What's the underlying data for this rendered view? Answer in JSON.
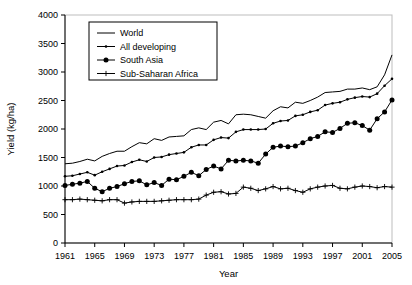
{
  "chart_data": {
    "type": "line",
    "title": "",
    "xlabel": "Year",
    "ylabel": "Yield (kg/ha)",
    "xlim": [
      1961,
      2005
    ],
    "ylim": [
      0,
      4000
    ],
    "ytick_step": 500,
    "xtick_step": 4,
    "grid": false,
    "legend_position": "top-left",
    "yticks": [
      "0",
      "500",
      "1000",
      "1500",
      "2000",
      "2500",
      "3000",
      "3500",
      "4000"
    ],
    "xticks": [
      "1961",
      "1965",
      "1969",
      "1973",
      "1977",
      "1981",
      "1985",
      "1989",
      "1993",
      "1997",
      "2001",
      "2005"
    ],
    "x": [
      1961,
      1962,
      1963,
      1964,
      1965,
      1966,
      1967,
      1968,
      1969,
      1970,
      1971,
      1972,
      1973,
      1974,
      1975,
      1976,
      1977,
      1978,
      1979,
      1980,
      1981,
      1982,
      1983,
      1984,
      1985,
      1986,
      1987,
      1988,
      1989,
      1990,
      1991,
      1992,
      1993,
      1994,
      1995,
      1996,
      1997,
      1998,
      1999,
      2000,
      2001,
      2002,
      2003,
      2004,
      2005
    ],
    "series": [
      {
        "name": "World",
        "marker": "none",
        "values": [
          1390,
          1400,
          1430,
          1470,
          1440,
          1520,
          1570,
          1610,
          1610,
          1690,
          1760,
          1740,
          1830,
          1800,
          1860,
          1870,
          1880,
          1990,
          2020,
          1990,
          2120,
          2150,
          2090,
          2250,
          2260,
          2250,
          2220,
          2190,
          2320,
          2390,
          2370,
          2470,
          2450,
          2500,
          2560,
          2640,
          2650,
          2660,
          2700,
          2700,
          2720,
          2690,
          2740,
          2950,
          3300
        ]
      },
      {
        "name": "All developing",
        "marker": "small-dot",
        "values": [
          1170,
          1180,
          1210,
          1240,
          1190,
          1250,
          1300,
          1350,
          1360,
          1420,
          1460,
          1430,
          1500,
          1510,
          1550,
          1570,
          1590,
          1680,
          1720,
          1720,
          1810,
          1850,
          1840,
          1950,
          1990,
          1990,
          1990,
          2000,
          2100,
          2140,
          2150,
          2230,
          2250,
          2300,
          2330,
          2420,
          2450,
          2470,
          2520,
          2550,
          2570,
          2560,
          2620,
          2760,
          2880
        ]
      },
      {
        "name": "South Asia",
        "marker": "filled-circle",
        "values": [
          1010,
          1030,
          1050,
          1080,
          960,
          900,
          960,
          990,
          1040,
          1080,
          1090,
          1020,
          1060,
          1010,
          1120,
          1110,
          1170,
          1240,
          1180,
          1290,
          1350,
          1300,
          1450,
          1440,
          1450,
          1440,
          1400,
          1560,
          1680,
          1700,
          1690,
          1700,
          1760,
          1830,
          1870,
          1950,
          1940,
          2010,
          2100,
          2110,
          2060,
          1980,
          2180,
          2300,
          2510
        ]
      },
      {
        "name": "Sub-Saharan Africa",
        "marker": "plus",
        "values": [
          760,
          760,
          770,
          760,
          750,
          740,
          760,
          760,
          700,
          720,
          730,
          730,
          730,
          740,
          750,
          760,
          760,
          760,
          770,
          840,
          890,
          900,
          860,
          870,
          980,
          960,
          920,
          950,
          990,
          950,
          960,
          920,
          890,
          950,
          980,
          1000,
          1010,
          960,
          950,
          980,
          1000,
          990,
          970,
          990,
          980
        ]
      }
    ]
  },
  "legend": {
    "items": [
      {
        "label": "World"
      },
      {
        "label": "All developing"
      },
      {
        "label": "South Asia"
      },
      {
        "label": "Sub-Saharan Africa"
      }
    ]
  }
}
